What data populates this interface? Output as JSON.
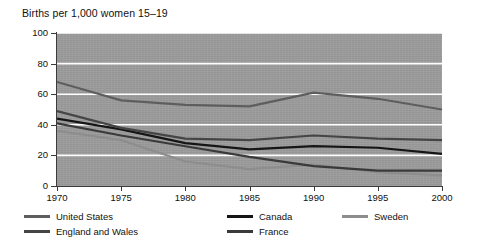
{
  "chart_data": {
    "type": "line",
    "title": "Births per 1,000 women 15–19",
    "xlabel": "",
    "ylabel": "",
    "x": [
      1970,
      1975,
      1980,
      1985,
      1990,
      1995,
      2000
    ],
    "xticklabels": [
      "1970",
      "1975",
      "1980",
      "1985",
      "1990",
      "1995",
      "2000"
    ],
    "yticklabels": [
      "0",
      "20",
      "40",
      "60",
      "80",
      "100"
    ],
    "yticks": [
      0,
      20,
      40,
      60,
      80,
      100
    ],
    "xlim": [
      1970,
      2000
    ],
    "ylim": [
      0,
      100
    ],
    "grid": true,
    "grid_color": "#ffffff",
    "plot_background": "#9c9c9c",
    "legend_position": "below",
    "series": [
      {
        "name": "United States",
        "color": "#5e5e5e",
        "values": [
          68,
          56,
          53,
          52,
          61,
          57,
          50
        ]
      },
      {
        "name": "Canada",
        "color": "#151515",
        "values": [
          44,
          37,
          28,
          24,
          26,
          25,
          21
        ]
      },
      {
        "name": "Sweden",
        "color": "#8d8d8d",
        "values": [
          36,
          30,
          16,
          11,
          14,
          9,
          7
        ]
      },
      {
        "name": "England and Wales",
        "color": "#454545",
        "values": [
          49,
          38,
          31,
          30,
          33,
          31,
          30
        ]
      },
      {
        "name": "France",
        "color": "#3a3a3a",
        "values": [
          41,
          33,
          26,
          19,
          13,
          10,
          10
        ]
      }
    ]
  },
  "legend": {
    "items": [
      {
        "label": "United States",
        "color": "#5e5e5e"
      },
      {
        "label": "Canada",
        "color": "#151515"
      },
      {
        "label": "Sweden",
        "color": "#8d8d8d"
      },
      {
        "label": "England and Wales",
        "color": "#454545"
      },
      {
        "label": "France",
        "color": "#3a3a3a"
      }
    ]
  }
}
